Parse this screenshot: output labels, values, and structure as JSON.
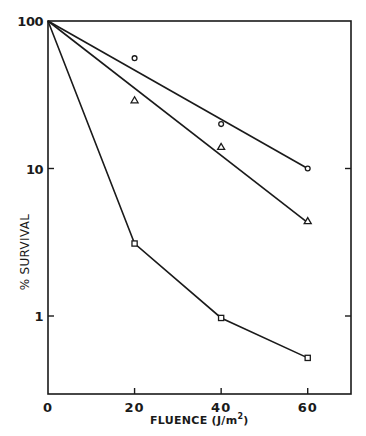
{
  "chart_data": {
    "type": "line",
    "title": "",
    "xlabel": "FLUENCE (J/m²)",
    "ylabel": "% SURVIVAL",
    "xlim": [
      0,
      70
    ],
    "ylim": [
      0.3,
      100
    ],
    "yscale": "log",
    "grid": false,
    "legend": "none",
    "x_ticks": [
      0,
      20,
      40,
      60
    ],
    "x_tick_labels": [
      "0",
      "20",
      "40",
      "60"
    ],
    "y_ticks": [
      100,
      10,
      1
    ],
    "y_tick_labels": [
      "100",
      "10",
      "1"
    ],
    "series": [
      {
        "name": "circles",
        "marker": "circle",
        "x": [
          0,
          20,
          40,
          60
        ],
        "values": [
          100,
          56,
          20,
          10
        ],
        "fit_line": {
          "x": [
            0,
            60
          ],
          "y": [
            100,
            10
          ]
        }
      },
      {
        "name": "triangles",
        "marker": "triangle",
        "x": [
          0,
          20,
          40,
          60
        ],
        "values": [
          100,
          29,
          14,
          4.4
        ],
        "fit_line": {
          "x": [
            0,
            60
          ],
          "y": [
            100,
            4.3
          ]
        }
      },
      {
        "name": "squares",
        "marker": "square",
        "x": [
          0,
          20,
          40,
          60
        ],
        "values": [
          100,
          3.1,
          0.97,
          0.52
        ],
        "fit_line": {
          "x": [
            0,
            20,
            40,
            60
          ],
          "y": [
            100,
            3.1,
            0.97,
            0.52
          ]
        }
      }
    ]
  },
  "labels": {
    "xlabel_main": "FLUENCE (J/m",
    "xlabel_sup": "2",
    "xlabel_close": ")",
    "ylabel": "% SURVIVAL"
  }
}
